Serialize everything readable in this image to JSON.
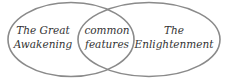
{
  "diagram": {
    "type": "venn",
    "stroke_color": "#8a8a8a",
    "text_color": "#333333",
    "sets": [
      {
        "label_line1": "The Great",
        "label_line2": "Awakening"
      },
      {
        "label_line1": "The",
        "label_line2": "Enlightenment"
      }
    ],
    "intersection": {
      "label_line1": "common",
      "label_line2": "features"
    }
  }
}
